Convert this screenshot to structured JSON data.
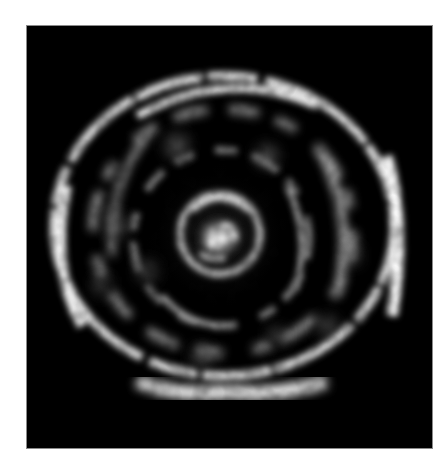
{
  "figure": {
    "background_color": "#000000",
    "frame_color": "#ffffff",
    "ring_color": "#ffffff"
  },
  "structure": {
    "center_core": {
      "cx": 192,
      "cy": 212,
      "r": 14
    },
    "inner_ring": {
      "cx": 192,
      "cy": 207,
      "rx": 40,
      "ry": 40
    },
    "middle_ring": {
      "cx": 194,
      "cy": 210,
      "rx": 88,
      "ry": 90
    },
    "second_ring": {
      "cx": 196,
      "cy": 205,
      "rx": 133,
      "ry": 125
    },
    "outer_ring": {
      "cx": 196,
      "cy": 200,
      "rx": 170,
      "ry": 152
    }
  }
}
